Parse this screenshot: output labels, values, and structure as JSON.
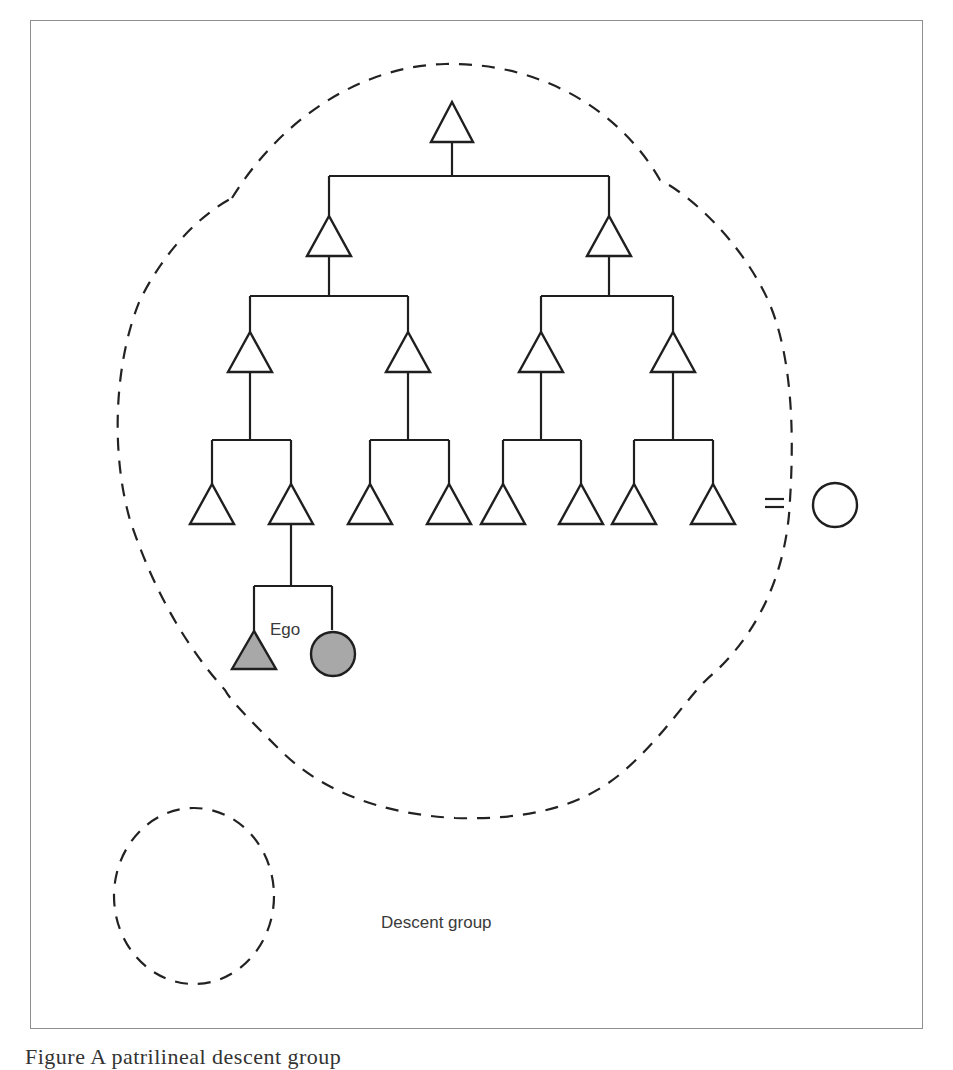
{
  "figure": {
    "labels": {
      "ego": "Ego",
      "legend": "Descent group"
    },
    "caption": "Figure      A patrilineal descent group",
    "colors": {
      "stroke": "#1f1f1f",
      "ego_fill": "#a8a8a8",
      "frame": "#8e8e8e",
      "dashed_boundary": "#222222"
    }
  },
  "kinship": {
    "generation_1": [
      {
        "symbol": "male",
        "filled": false
      }
    ],
    "generation_2": [
      {
        "symbol": "male",
        "filled": false
      },
      {
        "symbol": "male",
        "filled": false
      }
    ],
    "generation_3": [
      {
        "symbol": "male",
        "filled": false
      },
      {
        "symbol": "male",
        "filled": false
      },
      {
        "symbol": "male",
        "filled": false
      },
      {
        "symbol": "male",
        "filled": false
      }
    ],
    "generation_4": [
      {
        "symbol": "male",
        "filled": false
      },
      {
        "symbol": "male",
        "filled": false
      },
      {
        "symbol": "male",
        "filled": false
      },
      {
        "symbol": "male",
        "filled": false
      },
      {
        "symbol": "male",
        "filled": false
      },
      {
        "symbol": "male",
        "filled": false
      },
      {
        "symbol": "male",
        "filled": false
      },
      {
        "symbol": "male",
        "filled": false
      }
    ],
    "marriage": {
      "symbol": "=",
      "spouse": "female",
      "spouse_outside_group": true
    },
    "generation_5": [
      {
        "symbol": "male",
        "filled": true,
        "label": "Ego"
      },
      {
        "symbol": "female",
        "filled": true
      }
    ]
  }
}
